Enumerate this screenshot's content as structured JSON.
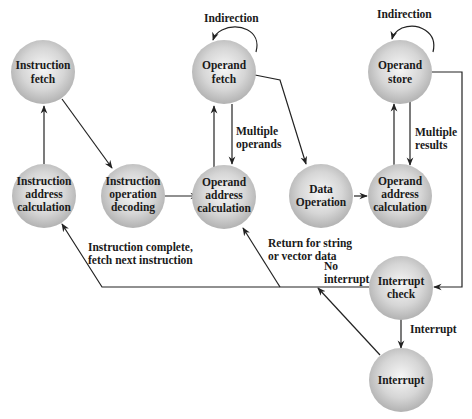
{
  "diagram": {
    "type": "instruction-cycle-state-diagram",
    "nodes": {
      "instruction_fetch": [
        "Instruction",
        "fetch"
      ],
      "instruction_address_calc": [
        "Instruction",
        "address",
        "calculation"
      ],
      "instruction_decoding": [
        "Instruction",
        "operation",
        "decoding"
      ],
      "operand_fetch": [
        "Operand",
        "fetch"
      ],
      "operand_address_calc_in": [
        "Operand",
        "address",
        "calculation"
      ],
      "data_operation": [
        "Data",
        "Operation"
      ],
      "operand_address_calc_out": [
        "Operand",
        "address",
        "calculation"
      ],
      "operand_store": [
        "Operand",
        "store"
      ],
      "interrupt_check": [
        "Interrupt",
        "check"
      ],
      "interrupt": [
        "Interrupt"
      ]
    },
    "edge_labels": {
      "indirection_fetch": "Indirection",
      "indirection_store": "Indirection",
      "multiple_operands": [
        "Multiple",
        "operands"
      ],
      "multiple_results": [
        "Multiple",
        "results"
      ],
      "instruction_complete": [
        "Instruction complete,",
        "fetch next instruction"
      ],
      "return_string": [
        "Return for string",
        "or vector data"
      ],
      "no_interrupt": [
        "No",
        "interrupt"
      ],
      "interrupt": "Interrupt"
    },
    "colors": {
      "node_fill_light": "#f4f4f4",
      "node_fill_dark": "#b4b4b4",
      "line": "#222222",
      "text": "#1a1a1a"
    }
  }
}
